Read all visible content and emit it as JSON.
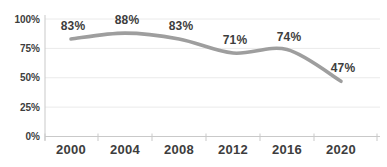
{
  "chart_data": {
    "type": "line",
    "title": "",
    "categories": [
      "2000",
      "2004",
      "2008",
      "2012",
      "2016",
      "2020"
    ],
    "values": [
      83,
      88,
      83,
      71,
      74,
      47
    ],
    "data_labels": [
      "83%",
      "88%",
      "83%",
      "71%",
      "74%",
      "47%"
    ],
    "y_ticks": [
      {
        "value": 0,
        "label": "0%"
      },
      {
        "value": 25,
        "label": "25%"
      },
      {
        "value": 50,
        "label": "50%"
      },
      {
        "value": 75,
        "label": "75%"
      },
      {
        "value": 100,
        "label": "100%"
      }
    ],
    "ylim": [
      0,
      100
    ],
    "grid": true,
    "legend": "none",
    "smooth": true,
    "colors": {
      "line": "#9e9e9e",
      "text": "#3d3d3d",
      "gridline": "#eaeaea",
      "axis": "#c9c9c9",
      "background": "#ffffff"
    }
  }
}
